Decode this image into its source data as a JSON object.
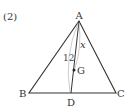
{
  "problem": {
    "number_label": "(2)"
  },
  "diagram": {
    "vertices": {
      "A": {
        "label": "A",
        "x": 79,
        "y": 21
      },
      "B": {
        "label": "B",
        "x": 29,
        "y": 93
      },
      "C": {
        "label": "C",
        "x": 116,
        "y": 93
      }
    },
    "points": {
      "D": {
        "label": "D",
        "x": 71,
        "y": 93
      },
      "G": {
        "label": "G",
        "x": 74,
        "y": 70
      }
    },
    "measurements": {
      "AD": "12",
      "AG": "x"
    },
    "colors": {
      "line": "#333333",
      "arc": "#999999",
      "text": "#333333"
    }
  }
}
